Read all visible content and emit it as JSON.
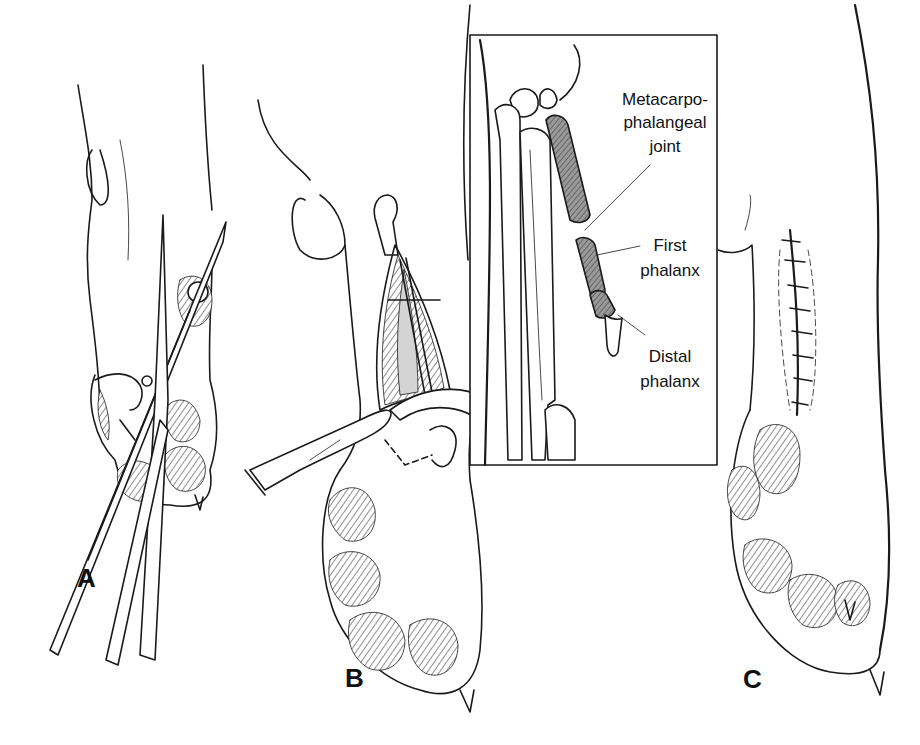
{
  "figure": {
    "panels": [
      {
        "id": "A",
        "label": "A",
        "description": "Scissors and forceps positioned around digit"
      },
      {
        "id": "B",
        "label": "B",
        "description": "Scalpel incision with retracted digit exposing tissue; inset of bones"
      },
      {
        "id": "C",
        "label": "C",
        "description": "Closed incision with sutures"
      }
    ],
    "inset": {
      "labels": {
        "joint_line1": "Metacarpo-",
        "joint_line2": "phalangeal",
        "joint_line3": "joint",
        "first_line1": "First",
        "first_line2": "phalanx",
        "distal_line1": "Distal",
        "distal_line2": "phalanx"
      }
    },
    "colors": {
      "ink": "#1a1a1a",
      "background": "#ffffff",
      "shaded_bone": "#8a8a8a",
      "tissue": "#d4d4d4"
    },
    "suture_count": 8
  }
}
